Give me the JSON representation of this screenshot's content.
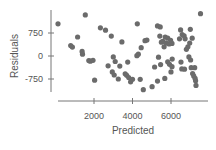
{
  "chart_data": {
    "type": "scatter",
    "title": "",
    "xlabel": "Predicted",
    "ylabel": "Residuals",
    "xlim": [
      -500,
      8000
    ],
    "ylim": [
      -1200,
      1400
    ],
    "xticks": [
      2000,
      4000,
      6000
    ],
    "xtick_labels": [
      "2000",
      "4000",
      "6000"
    ],
    "yticks": [
      750,
      0,
      -750
    ],
    "ytick_labels": [
      "750",
      "0",
      "-750"
    ],
    "grid": false,
    "legend": null,
    "marker_color": "#6b6b6b",
    "points": [
      [
        130,
        1050
      ],
      [
        1550,
        1340
      ],
      [
        790,
        340
      ],
      [
        880,
        290
      ],
      [
        1380,
        150
      ],
      [
        1400,
        60
      ],
      [
        1730,
        -150
      ],
      [
        1810,
        -170
      ],
      [
        1950,
        -140
      ],
      [
        2030,
        -790
      ],
      [
        1150,
        620
      ],
      [
        2330,
        920
      ],
      [
        2600,
        840
      ],
      [
        2730,
        -320
      ],
      [
        2950,
        -520
      ],
      [
        3050,
        -620
      ],
      [
        3260,
        -750
      ],
      [
        3000,
        -30
      ],
      [
        3100,
        -180
      ],
      [
        2900,
        650
      ],
      [
        3340,
        -330
      ],
      [
        3450,
        460
      ],
      [
        3750,
        -200
      ],
      [
        3620,
        -580
      ],
      [
        3700,
        -630
      ],
      [
        3800,
        -700
      ],
      [
        3900,
        -840
      ],
      [
        4000,
        -760
      ],
      [
        4230,
        10
      ],
      [
        4300,
        60
      ],
      [
        4450,
        270
      ],
      [
        4650,
        500
      ],
      [
        4750,
        520
      ],
      [
        4250,
        1050
      ],
      [
        4400,
        -760
      ],
      [
        4560,
        -1100
      ],
      [
        5020,
        -1000
      ],
      [
        5150,
        -360
      ],
      [
        5300,
        980
      ],
      [
        5440,
        950
      ],
      [
        5350,
        -40
      ],
      [
        5420,
        650
      ],
      [
        5500,
        450
      ],
      [
        5580,
        480
      ],
      [
        5640,
        300
      ],
      [
        5700,
        620
      ],
      [
        5750,
        420
      ],
      [
        5830,
        580
      ],
      [
        5900,
        390
      ],
      [
        5980,
        510
      ],
      [
        6050,
        410
      ],
      [
        5460,
        -280
      ],
      [
        5680,
        -730
      ],
      [
        5830,
        -190
      ],
      [
        5920,
        -270
      ],
      [
        6000,
        -520
      ],
      [
        6050,
        -350
      ],
      [
        6060,
        -100
      ],
      [
        5300,
        -820
      ],
      [
        6500,
        850
      ],
      [
        6580,
        700
      ],
      [
        6680,
        660
      ],
      [
        6730,
        560
      ],
      [
        6440,
        560
      ],
      [
        6520,
        -200
      ],
      [
        6560,
        -420
      ],
      [
        6700,
        -430
      ],
      [
        6800,
        220
      ],
      [
        6880,
        300
      ],
      [
        6970,
        420
      ],
      [
        6930,
        -30
      ],
      [
        7020,
        -130
      ],
      [
        7050,
        -380
      ],
      [
        7120,
        -570
      ],
      [
        7180,
        -650
      ],
      [
        7230,
        -380
      ],
      [
        7250,
        -730
      ],
      [
        7280,
        -810
      ],
      [
        7300,
        -960
      ],
      [
        7000,
        870
      ],
      [
        7100,
        580
      ],
      [
        7530,
        1380
      ]
    ]
  }
}
